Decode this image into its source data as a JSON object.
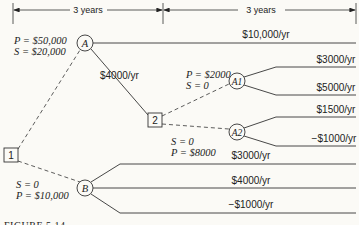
{
  "dimensions": [
    {
      "label": "3 years",
      "from": "decision-1",
      "to": "decision-2"
    },
    {
      "label": "3 years",
      "from": "decision-2",
      "to": "end"
    }
  ],
  "nodes": {
    "decision_1": {
      "label": "1",
      "type": "decision"
    },
    "decision_2": {
      "label": "2",
      "type": "decision"
    },
    "chance_A": {
      "label": "A",
      "type": "chance",
      "params": {
        "P": "P = $50,000",
        "S": "S = $20,000"
      }
    },
    "chance_B": {
      "label": "B",
      "type": "chance",
      "params": {
        "S": "S = 0",
        "P": "P = $10,000"
      }
    },
    "chance_A1": {
      "label": "A1",
      "type": "chance",
      "params": {
        "P": "P = $2000",
        "S": "S = 0"
      }
    },
    "chance_A2": {
      "label": "A2",
      "type": "chance",
      "params": {
        "S": "S = 0",
        "P": "P = $8000"
      }
    }
  },
  "branches": {
    "A_high": "$10,000/yr",
    "A_low": "$4000/yr",
    "A1_high": "$3000/yr",
    "A1_low": "$5000/yr",
    "A2_high": "$1500/yr",
    "A2_low": "−$1000/yr",
    "B_high": "$3000/yr",
    "B_mid": "$4000/yr",
    "B_low": "−$1000/yr"
  },
  "caption": "FIGURE 5.14"
}
